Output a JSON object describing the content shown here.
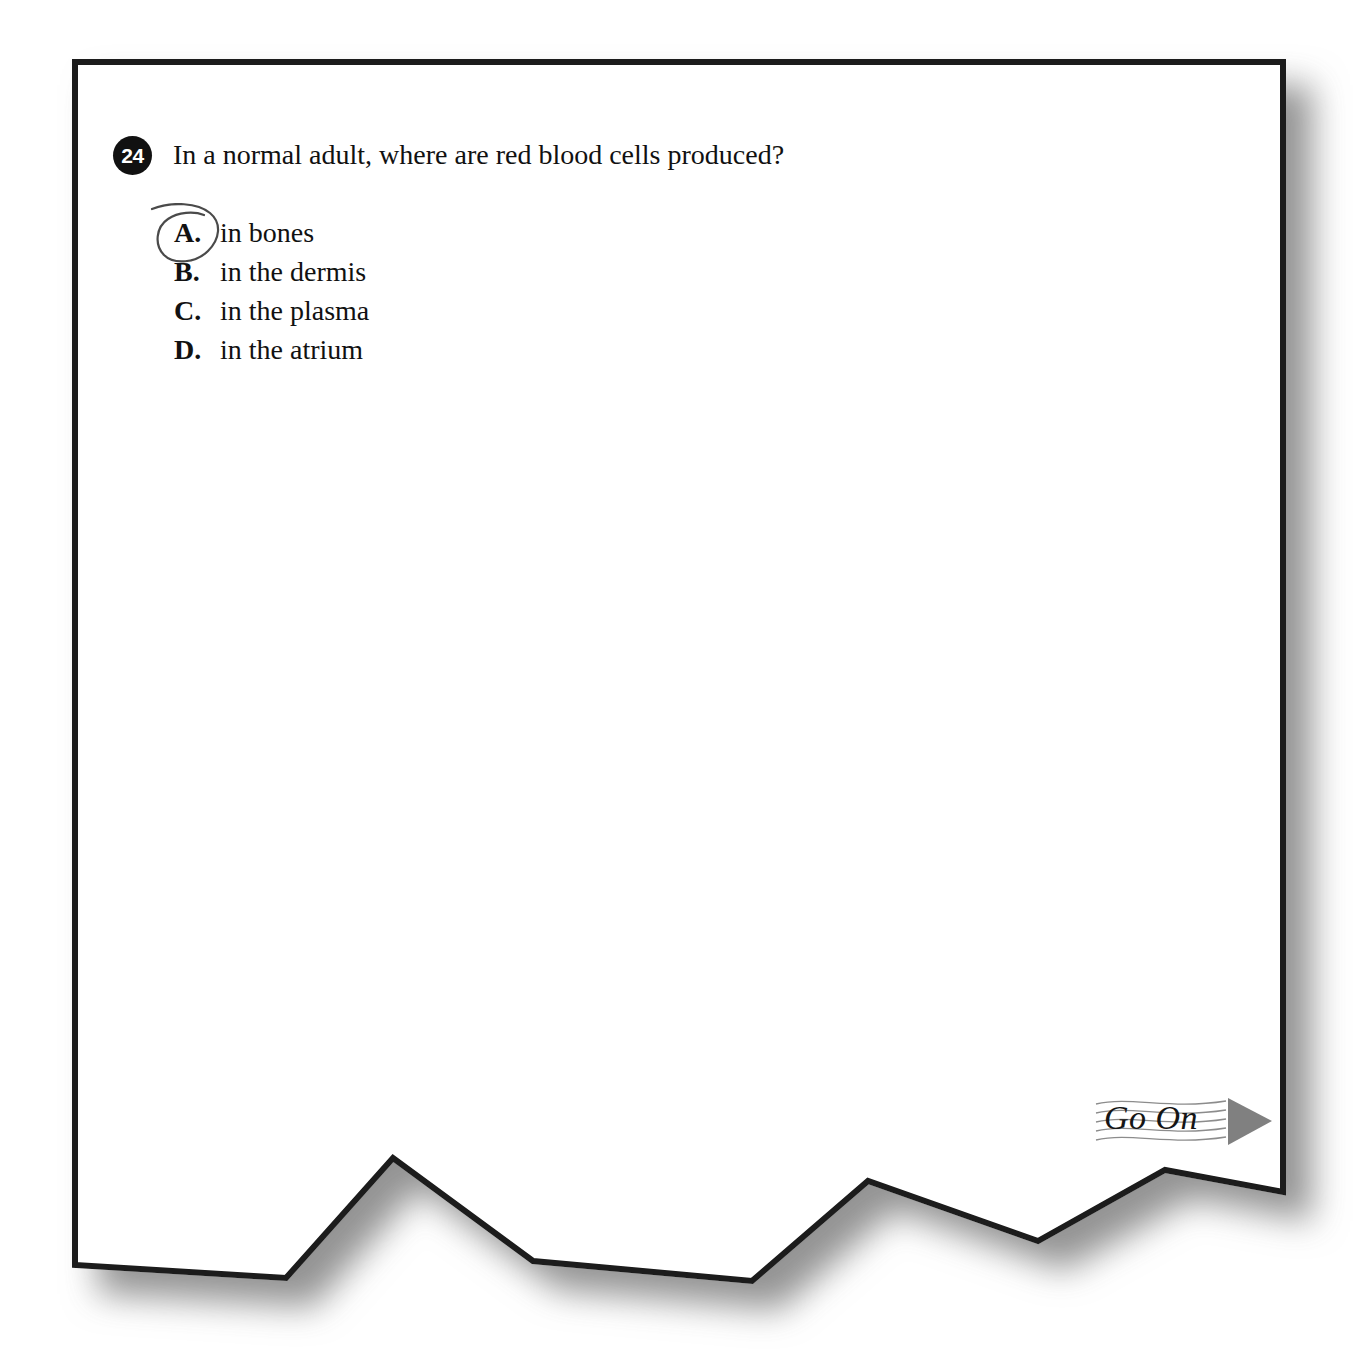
{
  "page": {
    "background_color": "#ffffff",
    "sheet_color": "#ffffff",
    "border_color": "#1a1a1a",
    "shadow_color": "#9a9a9a"
  },
  "question": {
    "number": "24",
    "stem": "In a normal adult, where are red blood cells produced?",
    "options": [
      {
        "letter": "A.",
        "text": "in bones"
      },
      {
        "letter": "B.",
        "text": "in the dermis"
      },
      {
        "letter": "C.",
        "text": "in the plasma"
      },
      {
        "letter": "D.",
        "text": "in the atrium"
      }
    ],
    "marked_option": "A.",
    "annotation": "hand-drawn-circle-around-option-a"
  },
  "footer": {
    "go_on_label": "Go On",
    "arrow_color": "#808080",
    "wave_line_color": "#8c8c8c"
  }
}
